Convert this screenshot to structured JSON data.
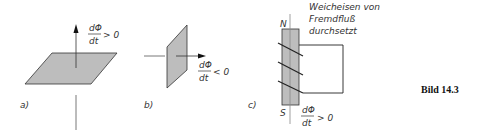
{
  "figure": {
    "caption": "Bild 14.3",
    "panels": [
      {
        "id": "a",
        "label": "a)",
        "formula_num": "dΦ",
        "formula_den": "dt",
        "relation": "> 0"
      },
      {
        "id": "b",
        "label": "b)",
        "formula_num": "dΦ",
        "formula_den": "dt",
        "relation": "< 0"
      },
      {
        "id": "c",
        "label": "c)",
        "formula_num": "dΦ",
        "formula_den": "dt",
        "relation": "> 0",
        "pole_top": "N",
        "pole_bottom": "S",
        "annotation": [
          "Weicheisen von",
          "Fremdfluß",
          "durchsetzt"
        ]
      }
    ],
    "colors": {
      "fill": "#bdbdbd",
      "stroke": "#333333"
    }
  }
}
